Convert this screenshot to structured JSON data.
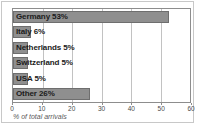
{
  "chart_data": {
    "type": "bar",
    "orientation": "horizontal",
    "title": "",
    "xlabel": "% of total arrivals",
    "ylabel": "",
    "xlim": [
      0,
      60
    ],
    "xticks": [
      0,
      10,
      20,
      30,
      40,
      50,
      60
    ],
    "xtick_labels": [
      "0",
      "10",
      "20",
      "30",
      "40",
      "50",
      "60"
    ],
    "grid": true,
    "legend": false,
    "categories": [
      "Germany",
      "Italy",
      "Netherlands",
      "Switzerland",
      "USA",
      "Other"
    ],
    "values": [
      53,
      6,
      5,
      5,
      5,
      26
    ],
    "data_labels": [
      "Germany 53%",
      "Italy 6%",
      "Netherlands 5%",
      "Switzerland 5%",
      "USA 5%",
      "Other 26%"
    ],
    "bar_color": "#8f8f8f",
    "bar_border_color": "#6e6e6e",
    "grid_color": "#c2c2c2",
    "axis_color": "#8d8d8d",
    "text_color": "#1b1b1b",
    "background": "#ffffff"
  }
}
